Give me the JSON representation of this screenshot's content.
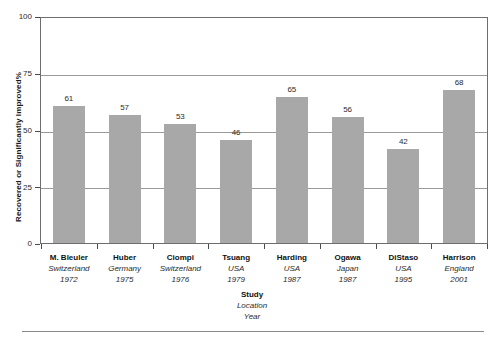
{
  "chart_data": {
    "type": "bar",
    "title": "",
    "subtitle": "",
    "xlabel": "Study",
    "xlabel_line2": "Location",
    "xlabel_line3": "Year",
    "ylabel": "Recovered or Significantly Improved%",
    "ylim": [
      0,
      100
    ],
    "yticks": [
      0,
      25,
      50,
      75,
      100
    ],
    "ytick_labels": [
      "0",
      "25",
      "50",
      "75",
      "100"
    ],
    "grid": "horizontal",
    "legend": "none",
    "bar_color": "#a8a8a8",
    "categories": [
      "M. Bleuler",
      "Huber",
      "Ciompi",
      "Tsuang",
      "Harding",
      "Ogawa",
      "DiStaso",
      "Harrison"
    ],
    "locations": [
      "Switzerland",
      "Germany",
      "Switzerland",
      "USA",
      "USA",
      "Japan",
      "USA",
      "England"
    ],
    "years": [
      "1972",
      "1975",
      "1976",
      "1979",
      "1987",
      "1987",
      "1995",
      "2001"
    ],
    "values": [
      61,
      57,
      53,
      46,
      65,
      56,
      42,
      68
    ],
    "value_labels": [
      "61",
      "57",
      "53",
      "46",
      "65",
      "56",
      "42",
      "68"
    ]
  }
}
